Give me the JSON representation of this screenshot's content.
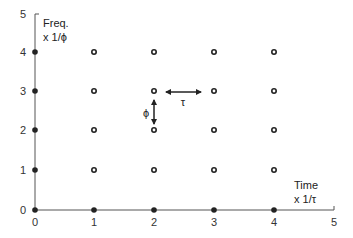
{
  "diagram": {
    "x_axis": {
      "title_line1": "Time",
      "title_line2": "x 1/τ",
      "ticks": [
        "0",
        "1",
        "2",
        "3",
        "4",
        "5"
      ]
    },
    "y_axis": {
      "title_line1": "Freq.",
      "title_line2": "x 1/ϕ",
      "ticks": [
        "0",
        "1",
        "2",
        "3",
        "4",
        "5"
      ]
    },
    "annotations": {
      "tau_label": "τ",
      "phi_label": "ϕ"
    },
    "grid_points": {
      "x_values": [
        0,
        1,
        2,
        3,
        4
      ],
      "y_values": [
        0,
        1,
        2,
        3,
        4
      ],
      "axis_points_style": "filled",
      "interior_points_style": "hollow"
    },
    "colors": {
      "points": "#222222",
      "axis": "#555555",
      "text": "#333333"
    }
  }
}
